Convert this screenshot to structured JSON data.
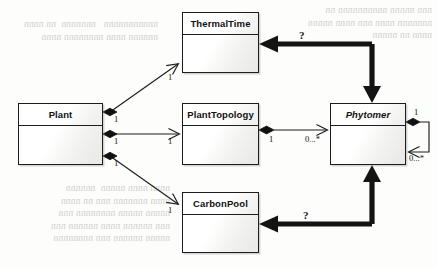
{
  "diagram": {
    "type": "uml-class-diagram",
    "title": "",
    "classes": [
      {
        "id": "thermaltime",
        "name": "ThermalTime",
        "abstract": false,
        "x": 182,
        "y": 12,
        "w": 77,
        "h": 61
      },
      {
        "id": "plant",
        "name": "Plant",
        "abstract": false,
        "x": 18,
        "y": 103,
        "w": 85,
        "h": 62
      },
      {
        "id": "planttopology",
        "name": "PlantTopology",
        "abstract": false,
        "x": 182,
        "y": 103,
        "w": 77,
        "h": 62
      },
      {
        "id": "phytomer",
        "name": "Phytomer",
        "abstract": true,
        "x": 330,
        "y": 103,
        "w": 76,
        "h": 62
      },
      {
        "id": "carbonpool",
        "name": "CarbonPool",
        "abstract": false,
        "x": 182,
        "y": 192,
        "w": 77,
        "h": 61
      }
    ],
    "associations": [
      {
        "id": "plant-thermaltime",
        "from": "plant",
        "to": "thermaltime",
        "kind": "composition",
        "source_multiplicity": "1",
        "target_multiplicity": "1"
      },
      {
        "id": "plant-planttopology",
        "from": "plant",
        "to": "planttopology",
        "kind": "composition",
        "source_multiplicity": "1",
        "target_multiplicity": "1"
      },
      {
        "id": "plant-carbonpool",
        "from": "plant",
        "to": "carbonpool",
        "kind": "composition",
        "source_multiplicity": "1",
        "target_multiplicity": "1"
      },
      {
        "id": "planttopology-phytomer",
        "from": "planttopology",
        "to": "phytomer",
        "kind": "composition",
        "source_multiplicity": "1",
        "target_multiplicity": "0...*"
      },
      {
        "id": "phytomer-phytomer",
        "from": "phytomer",
        "to": "phytomer",
        "kind": "composition",
        "source_multiplicity": "1",
        "target_multiplicity": "0...*"
      }
    ],
    "bold_links": [
      {
        "id": "phytomer-thermaltime-bold",
        "from": "phytomer",
        "to": "thermaltime",
        "label": "?"
      },
      {
        "id": "phytomer-carbonpool-bold",
        "from": "phytomer",
        "to": "carbonpool",
        "label": "?"
      }
    ],
    "labels": {
      "one": "1",
      "zero_to_many": "0...*",
      "question": "?"
    },
    "colors": {
      "line": "#1d1d1d",
      "box_fill": "#ffffff",
      "box_fill_shade": "#e8e8e5",
      "bold_link": "#141414",
      "background": "#fdfdfc",
      "bleed_text": "#c9c9c4"
    }
  },
  "background_text": {
    "top_left": "paragraph-bleed-through",
    "lines": [
      "nnnnnnnnn  nnnnnnn n n nnn",
      "nnnnnnn nnnn nnnnnnnnnn nnn",
      "nnnn  nnnnn nnnn nnnnn n nnnn",
      "nnnnnn n nnnnnnn nnnn"
    ]
  }
}
